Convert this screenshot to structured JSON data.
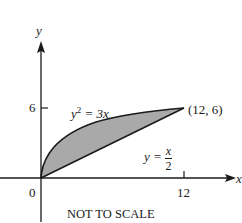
{
  "figure": {
    "type": "region-between-curves",
    "axes": {
      "x_label": "x",
      "y_label": "y",
      "origin_label": "0",
      "x_tick_label": "12",
      "y_tick_label": "6"
    },
    "curves": {
      "upper": {
        "equation_lhs": "y",
        "equation_exp": "2",
        "equation_rhs": "= 3x",
        "equation_text": "y² = 3x"
      },
      "lower": {
        "equation_lhs": "y =",
        "numerator": "x",
        "denominator": "2",
        "equation_text": "y = x/2"
      }
    },
    "intersection_point_label": "(12, 6)",
    "intersections": [
      [
        0,
        0
      ],
      [
        12,
        6
      ]
    ],
    "caption": "NOT TO SCALE",
    "colors": {
      "shaded_region": "#a9a9a9",
      "lines": "#1a1a1a",
      "background": "#ffffff"
    }
  }
}
